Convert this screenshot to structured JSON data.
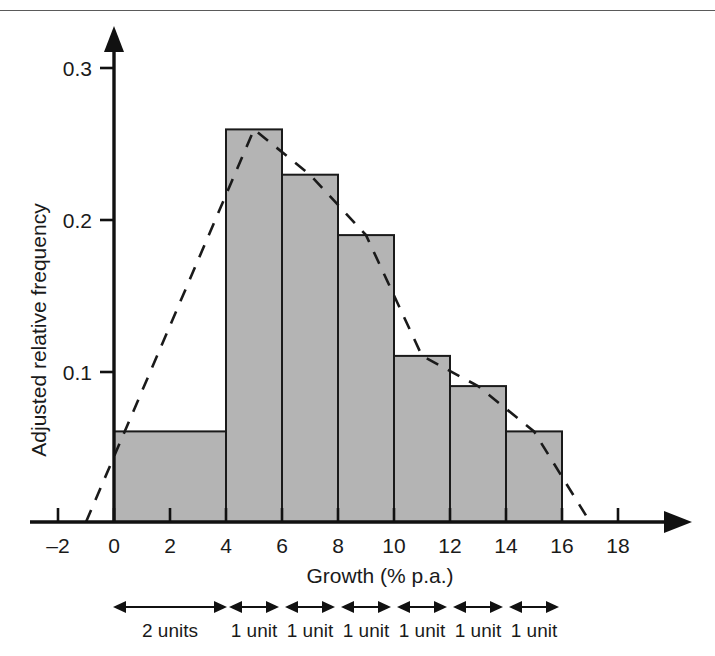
{
  "chart_data": {
    "type": "bar",
    "title": "",
    "subtitle": "",
    "xlabel": "Growth (% p.a.)",
    "ylabel": "Adjusted relative frequency",
    "xlim": [
      -2,
      18
    ],
    "ylim": [
      0,
      0.33
    ],
    "grid": false,
    "legend": "none",
    "categories": [
      "0–4",
      "4–6",
      "6–8",
      "8–10",
      "10–12",
      "12–14",
      "14–16"
    ],
    "bin_edges": [
      0,
      4,
      6,
      8,
      10,
      12,
      14,
      16
    ],
    "values": [
      0.06,
      0.26,
      0.23,
      0.19,
      0.11,
      0.09,
      0.06
    ],
    "bin_widths_units": [
      2,
      1,
      1,
      1,
      1,
      1,
      1
    ],
    "series": [
      {
        "name": "Adjusted relative frequency",
        "values": [
          0.06,
          0.26,
          0.23,
          0.19,
          0.11,
          0.09,
          0.06
        ]
      },
      {
        "name": "Frequency polygon",
        "type": "line",
        "style": "dashed",
        "x": [
          -1,
          5,
          7,
          9,
          11,
          13,
          15,
          17
        ],
        "y": [
          0,
          0.26,
          0.23,
          0.19,
          0.11,
          0.09,
          0.06,
          0
        ]
      }
    ],
    "x_ticks": [
      -2,
      0,
      2,
      4,
      6,
      8,
      10,
      12,
      14,
      16,
      18
    ],
    "x_tick_labels": [
      "–2",
      "0",
      "2",
      "4",
      "6",
      "8",
      "10",
      "12",
      "14",
      "16",
      "18"
    ],
    "y_ticks": [
      0.1,
      0.2,
      0.3
    ],
    "y_tick_labels": [
      "0.1",
      "0.2",
      "0.3"
    ],
    "colors": {
      "bar_fill": "#b4b4b4",
      "bar_stroke": "#1a1a1a",
      "axis": "#111111",
      "polygon": "#1a1a1a",
      "background": "#ffffff"
    }
  },
  "annotations": {
    "width_brackets": [
      {
        "label": "2 units",
        "from": 0,
        "to": 4
      },
      {
        "label": "1 unit",
        "from": 4,
        "to": 6
      },
      {
        "label": "1 unit",
        "from": 6,
        "to": 8
      },
      {
        "label": "1 unit",
        "from": 8,
        "to": 10
      },
      {
        "label": "1 unit",
        "from": 10,
        "to": 12
      },
      {
        "label": "1 unit",
        "from": 12,
        "to": 14
      },
      {
        "label": "1 unit",
        "from": 14,
        "to": 16
      }
    ]
  }
}
